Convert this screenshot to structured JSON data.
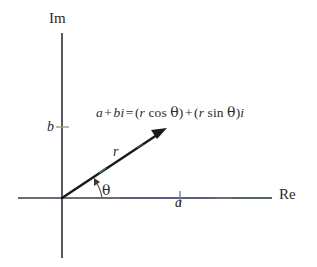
{
  "figure": {
    "type": "complex-plane-polar-form-diagram",
    "background_color": "#ffffff",
    "axis_color": "#3a3a46",
    "vector_color": "#1a1a1a",
    "text_color": "#2b2b2b"
  },
  "axes": {
    "imaginary": {
      "label": "Im",
      "orientation": "vertical",
      "x_px": 62,
      "top_px": 33,
      "bottom_px": 258
    },
    "real": {
      "label": "Re",
      "orientation": "horizontal",
      "y_px": 198,
      "left_px": 18,
      "right_px": 272
    }
  },
  "origin": {
    "x_px": 62,
    "y_px": 198
  },
  "ticks": [
    {
      "name": "b",
      "label": "b",
      "axis": "imaginary",
      "x_px": 62,
      "y_px": 127
    },
    {
      "name": "a",
      "label": "a",
      "axis": "real",
      "x_px": 180,
      "y_px": 198
    }
  ],
  "vector": {
    "label": "r",
    "from": {
      "x_px": 62,
      "y_px": 198
    },
    "to": {
      "x_px": 166,
      "y_px": 129
    },
    "arrowhead": true
  },
  "angle": {
    "label": "θ",
    "symbol_name": "theta",
    "from_axis": "real",
    "to": "vector"
  },
  "equation": {
    "lhs_a": "a",
    "plus_1": "+",
    "lhs_bi": "bi",
    "equals": "=",
    "open_1": "(",
    "r_1": "r",
    "cos": "cos",
    "theta_1": "θ",
    "close_1": ")",
    "plus_2": "+",
    "open_2": "(",
    "r_2": "r",
    "sin": "sin",
    "theta_2": "θ",
    "close_2": ")",
    "trailing_i": "i",
    "full_text": "a + bi = (r cos θ) + (r sin θ)i"
  }
}
